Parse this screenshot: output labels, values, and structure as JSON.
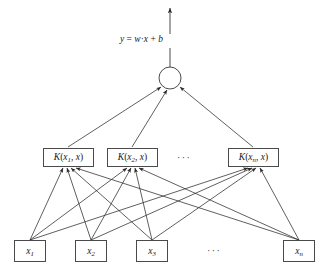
{
  "diagram": {
    "background_color": "#ffffff",
    "stroke_color": "#2b2b2b",
    "box_border_color": "#4a4a4a",
    "text_color": "#1a1a1a",
    "output": {
      "formula": "y = w · x + b",
      "formula_parts": {
        "lhs": "y",
        "equals": "=",
        "weight": "w",
        "dot": "·",
        "input": "x",
        "plus": "+",
        "bias": "b"
      }
    },
    "sum_node": {
      "label": "",
      "shape": "circle",
      "cx": 170,
      "cy": 78,
      "r": 11
    },
    "kernel_layer": {
      "ellipsis": "···",
      "nodes": [
        {
          "label_fn": "K",
          "open": "(",
          "arg": "x",
          "arg_sub": "1",
          "sep": ", ",
          "arg2": "x",
          "close": ")",
          "x": 43,
          "y": 148
        },
        {
          "label_fn": "K",
          "open": "(",
          "arg": "x",
          "arg_sub": "2",
          "sep": ", ",
          "arg2": "x",
          "close": ")",
          "x": 107,
          "y": 148
        },
        {
          "label_fn": "K",
          "open": "(",
          "arg": "x",
          "arg_sub": "n",
          "sep": ", ",
          "arg2": "x",
          "close": ")",
          "x": 228,
          "y": 148
        }
      ]
    },
    "input_layer": {
      "ellipsis": "···",
      "nodes": [
        {
          "base": "x",
          "sub": "1",
          "x": 14,
          "y": 240
        },
        {
          "base": "x",
          "sub": "2",
          "x": 75,
          "y": 240
        },
        {
          "base": "x",
          "sub": "3",
          "x": 136,
          "y": 240
        },
        {
          "base": "x",
          "sub": "n",
          "x": 283,
          "y": 240
        }
      ]
    },
    "edges": {
      "input_to_kernel_count": 12,
      "kernel_to_sum_count": 3,
      "sum_to_output_count": 1
    }
  }
}
